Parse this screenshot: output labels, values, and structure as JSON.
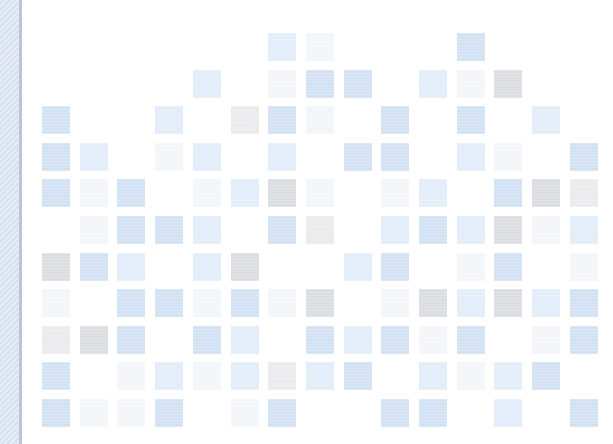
{
  "pattern": {
    "description": "Decorative mosaic of pastel squares",
    "grid": {
      "columns": 15,
      "rows": 11,
      "origin_x": 42,
      "origin_y": 33,
      "pitch_x": 37.7,
      "pitch_y": 36.6,
      "tile_size": 28
    },
    "palette": {
      "B": "#d3e2f3",
      "L": "#e3edf9",
      "P": "#f3f5f8",
      "G": "#dcdde0",
      "g": "#ebebed"
    },
    "rows": [
      "......LP...B...",
      "....L.PBB.LPG..",
      "B..L.gBP.B.B.L.",
      "BL.PL.L.BB.LP.B",
      "BPB.PLGP.PL.BGg",
      ".PBBL.Bg.LBLGPLg",
      "GBL.LG..LB.PB.P",
      "P.BBPBPG.PGLGLB",
      "gGB.BL.BLBPB.PB",
      "B.PLPLgLB.LPLB.",
      "BPPB.PB..BB.L.B"
    ],
    "side_strip": {
      "stripe_a": "#e6edf7",
      "stripe_b": "#d6e0ef",
      "border": "#bcc4d6"
    }
  }
}
